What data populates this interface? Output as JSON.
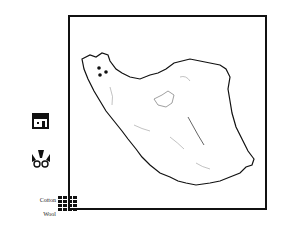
{
  "map": {
    "region": "Iran outline map",
    "markers": [
      {
        "type": "dot",
        "x": 29,
        "y": 51
      },
      {
        "type": "dot",
        "x": 36,
        "y": 55
      },
      {
        "type": "dot",
        "x": 30,
        "y": 58
      }
    ]
  },
  "legend": {
    "icons": [
      {
        "name": "house-icon"
      },
      {
        "name": "loom-icon"
      }
    ],
    "materials": [
      {
        "label": "Cotton"
      },
      {
        "label": "Wool"
      }
    ]
  },
  "colors": {
    "ink": "#111111",
    "rivers": "#888888",
    "background": "#ffffff"
  }
}
